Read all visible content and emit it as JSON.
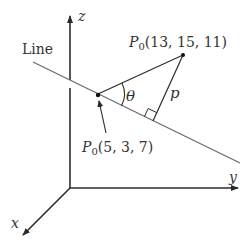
{
  "diagram": {
    "axes": {
      "z_label": "z",
      "y_label": "y",
      "x_label": "x"
    },
    "line_label": "Line",
    "point_on_line": {
      "symbol": "P",
      "subscript": "0",
      "coords": "(5, 3, 7)"
    },
    "external_point": {
      "symbol": "P",
      "subscript": "0",
      "coords": "(13, 15, 11)"
    },
    "angle_label": "θ",
    "distance_label": "p",
    "colors": {
      "axis": "#2b2b2b",
      "line": "#6b6b6b",
      "text": "#333333"
    }
  }
}
